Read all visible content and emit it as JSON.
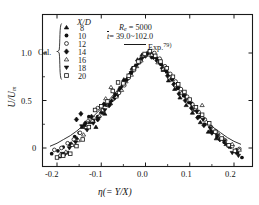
{
  "figure": {
    "background": "#ffffff",
    "frame_color": "#1a1a1a",
    "marker_color": "#111111",
    "curve_color": "#333333"
  },
  "legend": {
    "header": "X/D",
    "group_label": "Cal.",
    "entries": [
      {
        "value": "8",
        "marker": "filled-triangle-up"
      },
      {
        "value": "10",
        "marker": "filled-circle"
      },
      {
        "value": "12",
        "marker": "open-circle"
      },
      {
        "value": "14",
        "marker": "filled-diamond"
      },
      {
        "value": "16",
        "marker": "open-triangle-up"
      },
      {
        "value": "18",
        "marker": "filled-triangle-down"
      },
      {
        "value": "20",
        "marker": "open-square"
      }
    ]
  },
  "annotations": {
    "reynolds_symbol": "R",
    "reynolds_sub": "e",
    "reynolds_value": "= 5000",
    "time_symbol": "t",
    "time_value": "= 39.0~102.0",
    "exp_label": "Exp.",
    "exp_ref": "79)"
  },
  "axes": {
    "x_title_symbol": "η",
    "x_title_rest": "(= Y/X)",
    "y_title": "U/U",
    "y_title_sub": "m",
    "x_ticks": [
      "-0.2",
      "-0.1",
      "0.0",
      "0.1",
      "0.2"
    ],
    "y_ticks": [
      "0",
      "0.5",
      "1.0"
    ]
  },
  "chart_data": {
    "type": "scatter",
    "title": "",
    "xlabel": "η (= Y/X)",
    "ylabel": "U/Um",
    "xlim": [
      -0.24,
      0.245
    ],
    "ylim": [
      -0.22,
      1.28
    ],
    "grid": false,
    "legend_position": "top-left-inside",
    "legend_title": "X/D",
    "annotations": [
      "Re = 5000",
      "t̄ = 39.0~102.0",
      "Exp. 79)"
    ],
    "series": [
      {
        "name": "8",
        "marker": "filled-triangle-up",
        "points": [
          [
            -0.195,
            -0.09
          ],
          [
            -0.175,
            -0.05
          ],
          [
            -0.155,
            0.1
          ],
          [
            -0.143,
            0.22
          ],
          [
            -0.126,
            0.27
          ],
          [
            -0.112,
            0.22
          ],
          [
            -0.1,
            0.38
          ],
          [
            -0.092,
            0.36
          ],
          [
            -0.079,
            0.47
          ],
          [
            -0.068,
            0.56
          ],
          [
            -0.06,
            0.6
          ],
          [
            -0.049,
            0.72
          ],
          [
            -0.04,
            0.74
          ],
          [
            -0.03,
            0.84
          ],
          [
            -0.018,
            0.93
          ],
          [
            -0.008,
            0.98
          ],
          [
            0.004,
            1.0
          ],
          [
            0.016,
            0.96
          ],
          [
            0.028,
            0.93
          ],
          [
            0.04,
            0.82
          ],
          [
            0.052,
            0.71
          ],
          [
            0.066,
            0.62
          ],
          [
            0.078,
            0.53
          ],
          [
            0.092,
            0.45
          ],
          [
            0.106,
            0.37
          ],
          [
            0.124,
            0.27
          ],
          [
            0.142,
            0.17
          ],
          [
            0.16,
            0.1
          ],
          [
            0.182,
            0.04
          ],
          [
            0.205,
            -0.02
          ]
        ]
      },
      {
        "name": "10",
        "marker": "filled-circle",
        "points": [
          [
            -0.212,
            -0.06
          ],
          [
            -0.198,
            -0.03
          ],
          [
            -0.186,
            0.01
          ],
          [
            -0.172,
            0.04
          ],
          [
            -0.16,
            0.12
          ],
          [
            -0.15,
            0.16
          ],
          [
            -0.138,
            0.24
          ],
          [
            -0.128,
            0.33
          ],
          [
            -0.118,
            0.29
          ],
          [
            -0.108,
            0.33
          ],
          [
            -0.098,
            0.37
          ],
          [
            -0.088,
            0.45
          ],
          [
            -0.076,
            0.5
          ],
          [
            -0.064,
            0.55
          ],
          [
            -0.052,
            0.66
          ],
          [
            -0.042,
            0.72
          ],
          [
            -0.032,
            0.8
          ],
          [
            -0.022,
            0.86
          ],
          [
            -0.012,
            0.93
          ],
          [
            0.0,
            0.99
          ],
          [
            0.012,
            1.0
          ],
          [
            0.024,
            0.95
          ],
          [
            0.036,
            0.88
          ],
          [
            0.048,
            0.8
          ],
          [
            0.06,
            0.72
          ],
          [
            0.072,
            0.63
          ],
          [
            0.086,
            0.55
          ],
          [
            0.098,
            0.48
          ],
          [
            0.11,
            0.4
          ],
          [
            0.122,
            0.33
          ],
          [
            0.134,
            0.25
          ],
          [
            0.148,
            0.18
          ],
          [
            0.162,
            0.12
          ],
          [
            0.178,
            0.06
          ],
          [
            0.192,
            0.01
          ],
          [
            0.208,
            -0.05
          ],
          [
            0.218,
            -0.1
          ]
        ]
      },
      {
        "name": "12",
        "marker": "open-circle",
        "points": [
          [
            -0.206,
            -0.02
          ],
          [
            -0.19,
            0.0
          ],
          [
            -0.176,
            0.05
          ],
          [
            -0.162,
            0.09
          ],
          [
            -0.148,
            0.16
          ],
          [
            -0.134,
            0.21
          ],
          [
            -0.12,
            0.28
          ],
          [
            -0.108,
            0.42
          ],
          [
            -0.096,
            0.4
          ],
          [
            -0.084,
            0.45
          ],
          [
            -0.072,
            0.52
          ],
          [
            -0.06,
            0.58
          ],
          [
            -0.048,
            0.66
          ],
          [
            -0.038,
            0.74
          ],
          [
            -0.026,
            0.82
          ],
          [
            -0.014,
            0.9
          ],
          [
            -0.004,
            0.97
          ],
          [
            0.008,
            1.01
          ],
          [
            0.02,
            1.0
          ],
          [
            0.032,
            0.94
          ],
          [
            0.044,
            0.86
          ],
          [
            0.056,
            0.78
          ],
          [
            0.068,
            0.7
          ],
          [
            0.08,
            0.62
          ],
          [
            0.094,
            0.54
          ],
          [
            0.106,
            0.46
          ],
          [
            0.12,
            0.38
          ],
          [
            0.134,
            0.3
          ],
          [
            0.148,
            0.22
          ],
          [
            0.164,
            0.14
          ],
          [
            0.18,
            0.08
          ],
          [
            0.196,
            0.02
          ],
          [
            0.212,
            -0.01
          ]
        ]
      },
      {
        "name": "14",
        "marker": "filled-diamond",
        "points": [
          [
            -0.184,
            -0.07
          ],
          [
            -0.168,
            0.04
          ],
          [
            -0.156,
            0.3
          ],
          [
            -0.146,
            0.36
          ],
          [
            -0.136,
            0.26
          ],
          [
            -0.122,
            0.33
          ],
          [
            -0.108,
            0.3
          ],
          [
            -0.094,
            0.46
          ],
          [
            -0.082,
            0.45
          ],
          [
            -0.07,
            0.53
          ],
          [
            -0.058,
            0.62
          ],
          [
            -0.046,
            0.7
          ],
          [
            -0.034,
            0.78
          ],
          [
            -0.024,
            0.85
          ],
          [
            -0.012,
            0.92
          ],
          [
            0.0,
            0.97
          ],
          [
            0.014,
            0.96
          ],
          [
            0.026,
            0.92
          ],
          [
            0.038,
            0.84
          ],
          [
            0.05,
            0.76
          ],
          [
            0.064,
            0.67
          ],
          [
            0.076,
            0.57
          ],
          [
            0.09,
            0.5
          ],
          [
            0.104,
            0.42
          ],
          [
            0.118,
            0.32
          ],
          [
            0.132,
            0.24
          ],
          [
            0.15,
            0.16
          ],
          [
            0.168,
            0.09
          ],
          [
            0.188,
            0.02
          ],
          [
            0.204,
            -0.04
          ]
        ]
      },
      {
        "name": "16",
        "marker": "open-triangle-up",
        "points": [
          [
            -0.194,
            -0.08
          ],
          [
            -0.18,
            -0.04
          ],
          [
            -0.166,
            0.03
          ],
          [
            -0.152,
            0.08
          ],
          [
            -0.14,
            0.14
          ],
          [
            -0.13,
            0.29
          ],
          [
            -0.116,
            0.32
          ],
          [
            -0.104,
            0.34
          ],
          [
            -0.09,
            0.52
          ],
          [
            -0.078,
            0.64
          ],
          [
            -0.066,
            0.54
          ],
          [
            -0.054,
            0.61
          ],
          [
            -0.044,
            0.7
          ],
          [
            -0.032,
            0.77
          ],
          [
            -0.02,
            0.86
          ],
          [
            -0.01,
            0.92
          ],
          [
            0.002,
            0.98
          ],
          [
            0.014,
            0.98
          ],
          [
            0.028,
            0.9
          ],
          [
            0.04,
            0.83
          ],
          [
            0.054,
            0.74
          ],
          [
            0.068,
            0.66
          ],
          [
            0.082,
            0.58
          ],
          [
            0.096,
            0.5
          ],
          [
            0.112,
            0.41
          ],
          [
            0.128,
            0.45
          ],
          [
            0.142,
            0.26
          ],
          [
            0.158,
            0.18
          ],
          [
            0.176,
            0.1
          ],
          [
            0.196,
            0.04
          ],
          [
            0.212,
            -0.02
          ]
        ]
      },
      {
        "name": "18",
        "marker": "filled-triangle-down",
        "points": [
          [
            -0.188,
            -0.06
          ],
          [
            -0.172,
            0.0
          ],
          [
            -0.158,
            0.06
          ],
          [
            -0.144,
            0.23
          ],
          [
            -0.132,
            0.19
          ],
          [
            -0.118,
            0.26
          ],
          [
            -0.106,
            0.31
          ],
          [
            -0.092,
            0.4
          ],
          [
            -0.08,
            0.48
          ],
          [
            -0.068,
            0.56
          ],
          [
            -0.056,
            0.63
          ],
          [
            -0.044,
            0.71
          ],
          [
            -0.032,
            0.79
          ],
          [
            -0.02,
            0.87
          ],
          [
            -0.008,
            0.94
          ],
          [
            0.004,
            0.99
          ],
          [
            0.018,
            0.95
          ],
          [
            0.032,
            0.89
          ],
          [
            0.046,
            0.81
          ],
          [
            0.06,
            0.72
          ],
          [
            0.074,
            0.63
          ],
          [
            0.088,
            0.55
          ],
          [
            0.102,
            0.47
          ],
          [
            0.116,
            0.38
          ],
          [
            0.13,
            0.3
          ],
          [
            0.146,
            0.21
          ],
          [
            0.162,
            0.13
          ],
          [
            0.178,
            0.07
          ],
          [
            0.196,
            -0.05
          ],
          [
            0.21,
            -0.08
          ]
        ]
      },
      {
        "name": "20",
        "marker": "open-square",
        "points": [
          [
            -0.2,
            -0.1
          ],
          [
            -0.186,
            -0.08
          ],
          [
            -0.17,
            -0.06
          ],
          [
            -0.156,
            0.02
          ],
          [
            -0.142,
            0.09
          ],
          [
            -0.128,
            0.22
          ],
          [
            -0.114,
            0.4
          ],
          [
            -0.1,
            0.44
          ],
          [
            -0.086,
            0.49
          ],
          [
            -0.074,
            0.6
          ],
          [
            -0.062,
            0.69
          ],
          [
            -0.05,
            0.68
          ],
          [
            -0.038,
            0.76
          ],
          [
            -0.026,
            0.84
          ],
          [
            -0.016,
            0.91
          ],
          [
            -0.002,
            0.99
          ],
          [
            0.01,
            1.02
          ],
          [
            0.022,
            0.97
          ],
          [
            0.034,
            0.91
          ],
          [
            0.048,
            0.84
          ],
          [
            0.062,
            0.75
          ],
          [
            0.074,
            0.67
          ],
          [
            0.088,
            0.59
          ],
          [
            0.1,
            0.51
          ],
          [
            0.114,
            0.43
          ],
          [
            0.128,
            0.35
          ],
          [
            0.144,
            0.26
          ],
          [
            0.158,
            0.17
          ],
          [
            0.172,
            0.1
          ],
          [
            0.188,
            0.03
          ],
          [
            0.202,
            -0.03
          ]
        ]
      }
    ],
    "curve": {
      "name": "Exp. 79)",
      "style": "solid-line",
      "points": [
        [
          -0.215,
          0.02
        ],
        [
          -0.2,
          0.05
        ],
        [
          -0.185,
          0.09
        ],
        [
          -0.17,
          0.13
        ],
        [
          -0.155,
          0.18
        ],
        [
          -0.14,
          0.24
        ],
        [
          -0.125,
          0.3
        ],
        [
          -0.11,
          0.37
        ],
        [
          -0.095,
          0.44
        ],
        [
          -0.08,
          0.52
        ],
        [
          -0.065,
          0.6
        ],
        [
          -0.05,
          0.68
        ],
        [
          -0.035,
          0.77
        ],
        [
          -0.022,
          0.86
        ],
        [
          -0.01,
          0.94
        ],
        [
          0.0,
          0.99
        ],
        [
          0.01,
          1.0
        ],
        [
          0.022,
          0.97
        ],
        [
          0.035,
          0.9
        ],
        [
          0.05,
          0.81
        ],
        [
          0.065,
          0.71
        ],
        [
          0.08,
          0.62
        ],
        [
          0.095,
          0.53
        ],
        [
          0.11,
          0.44
        ],
        [
          0.125,
          0.36
        ],
        [
          0.14,
          0.28
        ],
        [
          0.155,
          0.21
        ],
        [
          0.17,
          0.16
        ],
        [
          0.185,
          0.11
        ],
        [
          0.2,
          0.07
        ],
        [
          0.215,
          0.04
        ]
      ]
    }
  }
}
